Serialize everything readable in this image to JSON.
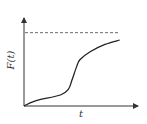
{
  "chart_data": {
    "type": "line",
    "title": "",
    "xlabel": "t",
    "ylabel": "F(t)",
    "xlim": [
      0,
      1
    ],
    "ylim": [
      0,
      1.2
    ],
    "grid": false,
    "legend": null,
    "asymptote": {
      "y": 1.0,
      "style": "dashed",
      "label": ""
    },
    "series": [
      {
        "name": "F(t)",
        "x": [
          0.0,
          0.1,
          0.32,
          0.39,
          0.42,
          0.46,
          0.49,
          0.58,
          0.71,
          0.84
        ],
        "y": [
          0.0,
          0.07,
          0.15,
          0.23,
          0.35,
          0.53,
          0.63,
          0.74,
          0.84,
          0.9
        ]
      }
    ]
  }
}
